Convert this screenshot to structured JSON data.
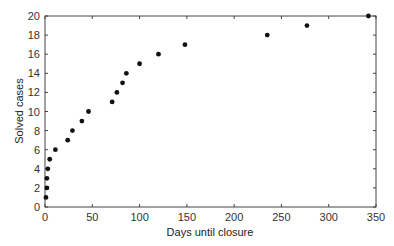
{
  "chart_data": {
    "type": "scatter",
    "title": "",
    "xlabel": "Days until closure",
    "ylabel": "Solved cases",
    "xlim": [
      0,
      350
    ],
    "ylim": [
      0,
      20
    ],
    "xticks": [
      0,
      50,
      100,
      150,
      200,
      250,
      300,
      350
    ],
    "yticks": [
      0,
      2,
      4,
      6,
      8,
      10,
      12,
      14,
      16,
      18,
      20
    ],
    "grid": false,
    "legend": null,
    "marker_color": "#111111",
    "series": [
      {
        "name": "Solved cases",
        "points": [
          {
            "x": 1,
            "y": 1
          },
          {
            "x": 2,
            "y": 2
          },
          {
            "x": 2,
            "y": 3
          },
          {
            "x": 3,
            "y": 4
          },
          {
            "x": 5,
            "y": 5
          },
          {
            "x": 11,
            "y": 6
          },
          {
            "x": 24,
            "y": 7
          },
          {
            "x": 29,
            "y": 8
          },
          {
            "x": 39,
            "y": 9
          },
          {
            "x": 46,
            "y": 10
          },
          {
            "x": 71,
            "y": 11
          },
          {
            "x": 76,
            "y": 12
          },
          {
            "x": 82,
            "y": 13
          },
          {
            "x": 86,
            "y": 14
          },
          {
            "x": 100,
            "y": 15
          },
          {
            "x": 120,
            "y": 16
          },
          {
            "x": 148,
            "y": 17
          },
          {
            "x": 235,
            "y": 18
          },
          {
            "x": 277,
            "y": 19
          },
          {
            "x": 342,
            "y": 20
          }
        ]
      }
    ]
  }
}
